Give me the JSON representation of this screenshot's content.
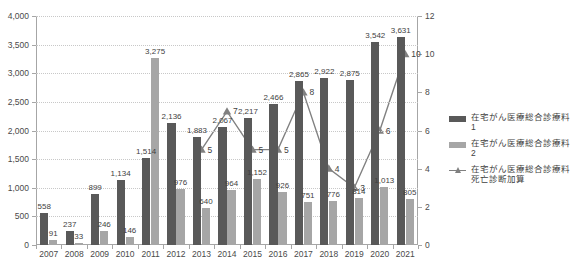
{
  "chart_data": {
    "type": "bar",
    "title": "",
    "xlabel": "",
    "ylabel": "",
    "categories": [
      "2007",
      "2008",
      "2009",
      "2010",
      "2011",
      "2012",
      "2013",
      "2014",
      "2015",
      "2016",
      "2017",
      "2018",
      "2019",
      "2020",
      "2021"
    ],
    "ylim": [
      0,
      4000
    ],
    "y_ticks": [
      "0",
      "500",
      "1,000",
      "1,500",
      "2,000",
      "2,500",
      "3,000",
      "3,500",
      "4,000"
    ],
    "y2lim": [
      0,
      12
    ],
    "y2_ticks": [
      "0",
      "2",
      "4",
      "6",
      "8",
      "10",
      "12"
    ],
    "grid": true,
    "legend_position": "right",
    "series": [
      {
        "name": "在宅がん医療総合診療料1",
        "type": "bar",
        "axis": "left",
        "color": "#595959",
        "values": [
          558,
          237,
          899,
          1134,
          1514,
          2136,
          1883,
          2067,
          2217,
          2466,
          2865,
          2922,
          2875,
          3542,
          3631
        ],
        "labels": [
          "558",
          "237",
          "899",
          "1,134",
          "1,514",
          "2,136",
          "1,883",
          "2,067",
          "2,217",
          "2,466",
          "2,865",
          "2,922",
          "2,875",
          "3,542",
          "3,631"
        ]
      },
      {
        "name": "在宅がん医療総合診療料2",
        "type": "bar",
        "axis": "left",
        "color": "#a6a6a6",
        "values": [
          91,
          33,
          246,
          146,
          3275,
          976,
          640,
          964,
          1152,
          926,
          751,
          776,
          814,
          1013,
          805
        ],
        "labels": [
          "91",
          "33",
          "246",
          "146",
          "3,275",
          "976",
          "640",
          "964",
          "1,152",
          "926",
          "751",
          "776",
          "814",
          "1,013",
          "805"
        ]
      },
      {
        "name": "在宅がん医療総合診療料 死亡診断加算",
        "type": "line",
        "axis": "right",
        "color": "#808080",
        "values": [
          null,
          null,
          null,
          null,
          null,
          null,
          5,
          7,
          5,
          5,
          8,
          4,
          3,
          6,
          10
        ],
        "labels": [
          "",
          "",
          "",
          "",
          "",
          "",
          "5",
          "7",
          "5",
          "5",
          "8",
          "4",
          "3",
          "6",
          "10"
        ]
      }
    ]
  },
  "legend": {
    "items": [
      {
        "label": "在宅がん医療総合診療料1",
        "key": "bar-swatch",
        "color": "#595959"
      },
      {
        "label": "在宅がん医療総合診療料2",
        "key": "bar-swatch",
        "color": "#a6a6a6"
      },
      {
        "label": "在宅がん医療総合診療料\n死亡診断加算",
        "key": "line-marker",
        "color": "#808080"
      }
    ]
  }
}
